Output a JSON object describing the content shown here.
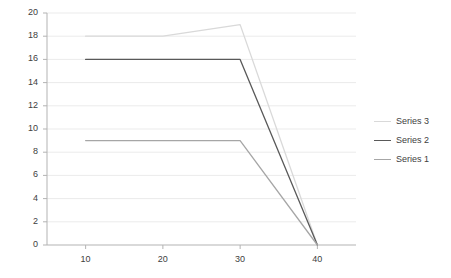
{
  "chart_data": {
    "type": "line",
    "title": "",
    "xlabel": "",
    "ylabel": "",
    "x": [
      10,
      20,
      30,
      40
    ],
    "xlim": [
      5,
      45
    ],
    "ylim": [
      0,
      20
    ],
    "yticks": [
      "0",
      "2",
      "4",
      "6",
      "8",
      "10",
      "12",
      "14",
      "16",
      "18",
      "20"
    ],
    "xticks": [
      "10",
      "20",
      "30",
      "40"
    ],
    "grid": "horizontal",
    "legend_position": "right",
    "series": [
      {
        "name": "Series 3",
        "values": [
          18,
          18,
          19,
          0
        ],
        "color": "#d9d9d9"
      },
      {
        "name": "Series 2",
        "values": [
          16,
          16,
          16,
          0
        ],
        "color": "#595959"
      },
      {
        "name": "Series 1",
        "values": [
          9,
          9,
          9,
          0
        ],
        "color": "#a6a6a6"
      }
    ]
  },
  "axis": {
    "line_color": "#b3b3b3",
    "grid_color": "#ebebeb",
    "tick_text_color": "#404040"
  }
}
